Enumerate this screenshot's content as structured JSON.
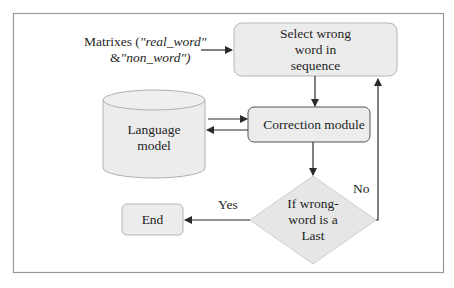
{
  "diagram": {
    "colors": {
      "frame": "#9a9a9a",
      "box_fill": "#ececec",
      "box_stroke": "#a8a8a8",
      "arrow": "#2a2a2a",
      "text": "#1f1f1f"
    },
    "input": {
      "line1_prefix": "Matrixes (",
      "line1_italic": "\"real_word\"",
      "line2_prefix": "&",
      "line2_italic": "\"non_word\")"
    },
    "nodes": {
      "select": {
        "line1": "Select wrong",
        "line2": "word in",
        "line3": "sequence"
      },
      "language_model": {
        "line1": "Language",
        "line2": "model"
      },
      "correction": {
        "label": "Correction module"
      },
      "decision": {
        "line1": "If wrong-",
        "line2": "word is a",
        "line3": "Last"
      },
      "end": {
        "label": "End"
      }
    },
    "edges": {
      "yes_label": "Yes",
      "no_label": "No"
    }
  }
}
